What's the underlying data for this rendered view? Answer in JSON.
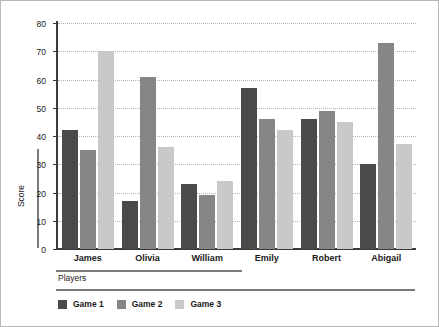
{
  "chart_data": {
    "type": "bar",
    "title": "",
    "subtitle": "",
    "xlabel": "Players",
    "ylabel": "Score",
    "categories": [
      "James",
      "Olivia",
      "William",
      "Emily",
      "Robert",
      "Abigail"
    ],
    "series": [
      {
        "name": "Game 1",
        "color": "#4a4a4a",
        "values": [
          42,
          17,
          23,
          57,
          46,
          30
        ]
      },
      {
        "name": "Game 2",
        "color": "#868686",
        "values": [
          35,
          61,
          19,
          46,
          49,
          73
        ]
      },
      {
        "name": "Game 3",
        "color": "#c9c9c9",
        "values": [
          70,
          36,
          24,
          42,
          45,
          37
        ]
      }
    ],
    "ylim": [
      0,
      80
    ],
    "yticks": [
      0,
      10,
      20,
      30,
      40,
      50,
      60,
      70,
      80
    ],
    "ytick_labels": [
      "0",
      "10",
      "20",
      "30",
      "40",
      "50",
      "60",
      "70",
      "80"
    ],
    "grid": true,
    "grid_axis": "y",
    "grid_style": "dotted",
    "legend_position": "bottom-left",
    "legend_entries": [
      "Game 1",
      "Game 2",
      "Game 3"
    ],
    "bar_mode": "grouped"
  }
}
